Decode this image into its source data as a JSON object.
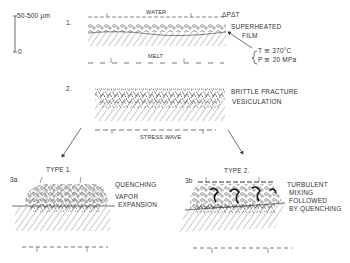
{
  "scale_bar": {
    "top_label": "50-500 µm",
    "bottom_label": "0"
  },
  "stage1": {
    "number": "1.",
    "water_label": "WATER",
    "delta_label": "ΔPΔT",
    "film_label_1": "SUPERHEATED",
    "film_label_2": "FILM",
    "temp_label": "T ≅ 370°C",
    "pressure_label": "P ≅ 20 MPa",
    "melt_label": "MELT"
  },
  "stage2": {
    "number": "2.",
    "label_1": "BRITTLE FRACTURE",
    "label_2": "VESICULATION",
    "wave_label": "STRESS WAVE"
  },
  "type1": {
    "title": "TYPE 1.",
    "id": "3a",
    "label_1": "QUENCHING",
    "label_2": "VAPOR",
    "label_3": "EXPANSION"
  },
  "type2": {
    "title": "TYPE 2.",
    "id": "3b",
    "label_1": "TURBULENT",
    "label_2": "MIXING",
    "label_3": "FOLLOWED",
    "label_4": "BY QUENCHING"
  }
}
